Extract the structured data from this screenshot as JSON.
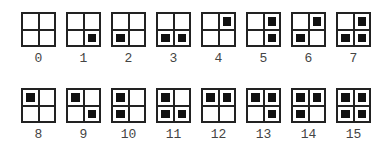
{
  "diagram": {
    "bit_order": [
      "top-left",
      "top-right",
      "bottom-left",
      "bottom-right"
    ],
    "colors": {
      "border": "#222222",
      "fill": "#111111",
      "label": "#444444",
      "background": "#ffffff"
    },
    "items": [
      {
        "label": "0",
        "bits": [
          0,
          0,
          0,
          0
        ]
      },
      {
        "label": "1",
        "bits": [
          0,
          0,
          0,
          1
        ]
      },
      {
        "label": "2",
        "bits": [
          0,
          0,
          1,
          0
        ]
      },
      {
        "label": "3",
        "bits": [
          0,
          0,
          1,
          1
        ]
      },
      {
        "label": "4",
        "bits": [
          0,
          1,
          0,
          0
        ]
      },
      {
        "label": "5",
        "bits": [
          0,
          1,
          0,
          1
        ]
      },
      {
        "label": "6",
        "bits": [
          0,
          1,
          1,
          0
        ]
      },
      {
        "label": "7",
        "bits": [
          0,
          1,
          1,
          1
        ]
      },
      {
        "label": "8",
        "bits": [
          1,
          0,
          0,
          0
        ]
      },
      {
        "label": "9",
        "bits": [
          1,
          0,
          0,
          1
        ]
      },
      {
        "label": "10",
        "bits": [
          1,
          0,
          1,
          0
        ]
      },
      {
        "label": "11",
        "bits": [
          1,
          0,
          1,
          1
        ]
      },
      {
        "label": "12",
        "bits": [
          1,
          1,
          0,
          0
        ]
      },
      {
        "label": "13",
        "bits": [
          1,
          1,
          0,
          1
        ]
      },
      {
        "label": "14",
        "bits": [
          1,
          1,
          1,
          0
        ]
      },
      {
        "label": "15",
        "bits": [
          1,
          1,
          1,
          1
        ]
      }
    ]
  }
}
